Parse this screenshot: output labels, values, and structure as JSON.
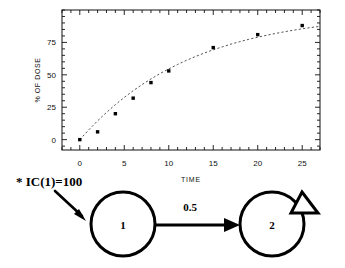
{
  "chart_data": {
    "type": "scatter",
    "title": "",
    "subtitle": "",
    "xlabel": "TIME",
    "ylabel": "% OF DOSE",
    "xlim": [
      -2,
      27
    ],
    "ylim": [
      -8,
      100
    ],
    "xticks": [
      0,
      5,
      10,
      15,
      20,
      25
    ],
    "xtick_labels": [
      "0",
      "5",
      "10",
      "15",
      "20",
      "25"
    ],
    "yticks": [
      0,
      25,
      50,
      75
    ],
    "ytick_labels": [
      "0",
      "25",
      "50",
      "75"
    ],
    "grid": false,
    "legend": "none",
    "frame": "box-all-sides-inward-ticks",
    "series": [
      {
        "name": "observed",
        "style": "markers",
        "marker": "filled-square",
        "x": [
          0,
          2,
          4,
          6,
          8,
          10,
          15,
          20,
          25
        ],
        "y": [
          0,
          6,
          20,
          32,
          44,
          53,
          71,
          81,
          88
        ]
      },
      {
        "name": "fitted",
        "style": "dashed-line",
        "x": [
          0,
          1,
          2,
          3,
          4,
          5,
          6,
          7,
          8,
          9,
          10,
          11,
          12,
          13,
          14,
          15,
          16,
          17,
          18,
          19,
          20,
          21,
          22,
          23,
          24,
          25,
          26,
          27
        ],
        "y": [
          0,
          7.5,
          14.5,
          21,
          27,
          32.6,
          37.7,
          42.5,
          46.8,
          50.9,
          54.6,
          58.0,
          61.2,
          64.1,
          66.8,
          69.3,
          71.5,
          73.7,
          75.6,
          77.4,
          79.0,
          80.5,
          81.9,
          83.2,
          84.4,
          85.5,
          86.5,
          87.4
        ]
      }
    ]
  },
  "diagram": {
    "initial_condition_label": "* IC(1)=100",
    "rate_label": "0.5",
    "compartment_1_label": "1",
    "compartment_2_label": "2",
    "input_arrow_name": "dose-input-arrow",
    "elimination_name": "elimination-triangle"
  },
  "colors": {
    "background": "#ffffff",
    "ink": "#111111",
    "marker": "#000000",
    "curve": "#555555"
  }
}
